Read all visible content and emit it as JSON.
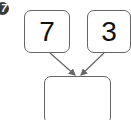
{
  "problem": {
    "number": "7",
    "parts": [
      {
        "value": "7"
      },
      {
        "value": "3"
      }
    ],
    "answer": {
      "value": ""
    }
  },
  "colors": {
    "badge": "#3a3a3a",
    "border": "#666666",
    "arrow": "#666666"
  }
}
